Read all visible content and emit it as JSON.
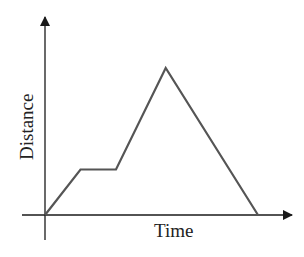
{
  "chart_data": {
    "type": "line",
    "title": "",
    "xlabel": "Time",
    "ylabel": "Distance",
    "grid": false,
    "legend": null,
    "ticks": "none",
    "x": [
      0,
      1,
      2,
      3.4,
      6
    ],
    "series": [
      {
        "name": "Distance vs Time",
        "values": [
          0,
          1.3,
          1.3,
          4.2,
          0
        ]
      }
    ],
    "note": "Qualitative distance-time graph: rise, flat segment, steep rise to peak, linear fall back to zero"
  },
  "labels": {
    "x_axis": "Time",
    "y_axis": "Distance"
  },
  "colors": {
    "axis": "#1a1a1a",
    "line": "#555555"
  }
}
